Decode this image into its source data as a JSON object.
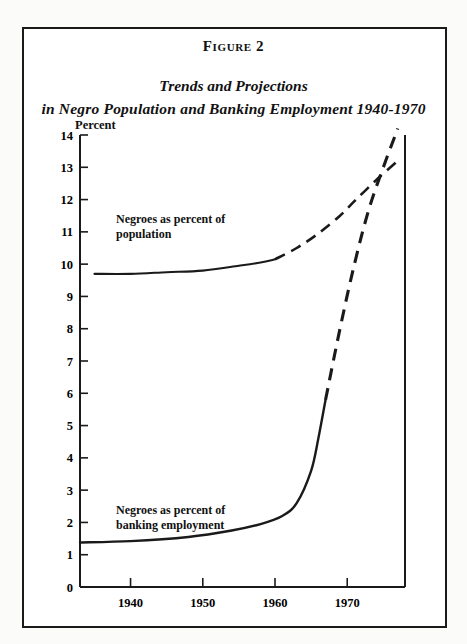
{
  "figure": {
    "number_label": "Figure 2",
    "title_line1": "Trends and Projections",
    "title_line2": "in Negro Population and Banking Employment 1940-1970",
    "unit_label": "Percent"
  },
  "annotations": {
    "population": {
      "line1": "Negroes as percent of",
      "line2": "population"
    },
    "banking": {
      "line1": "Negroes as percent of",
      "line2": "banking employment"
    }
  },
  "colors": {
    "ink": "#1a1a1a",
    "paper": "#ffffff",
    "page": "#fbfbfa"
  },
  "chart_data": {
    "type": "line",
    "title": "Trends and Projections in Negro Population and Banking Employment 1940-1970",
    "xlabel": "",
    "ylabel": "Percent",
    "xlim": [
      1933,
      1978
    ],
    "ylim": [
      0,
      14
    ],
    "grid": false,
    "legend": "inline-annotations",
    "yticks": [
      0,
      1,
      2,
      3,
      4,
      5,
      6,
      7,
      8,
      9,
      10,
      11,
      12,
      13,
      14
    ],
    "ytick_labels": [
      "0",
      "1",
      "2",
      "3",
      "4",
      "5",
      "6",
      "7",
      "8",
      "9",
      "10",
      "11",
      "12",
      "13",
      "14"
    ],
    "xticks": [
      1940,
      1950,
      1960,
      1970
    ],
    "xtick_labels": [
      "1940",
      "1950",
      "1960",
      "1970"
    ],
    "series": [
      {
        "name": "Negroes as percent of population",
        "style": "solid-then-dashed",
        "solid_x": [
          1935,
          1940,
          1945,
          1950,
          1955,
          1958,
          1960
        ],
        "solid_y": [
          9.7,
          9.7,
          9.75,
          9.8,
          9.95,
          10.05,
          10.15
        ],
        "dashed_x": [
          1960,
          1963,
          1966,
          1969,
          1971,
          1974,
          1977
        ],
        "dashed_y": [
          10.15,
          10.5,
          10.95,
          11.5,
          11.95,
          12.6,
          13.2
        ]
      },
      {
        "name": "Negroes as percent of banking employment",
        "style": "solid-then-dashed",
        "solid_x": [
          1933,
          1940,
          1948,
          1954,
          1958,
          1961,
          1963,
          1965,
          1966,
          1967
        ],
        "solid_y": [
          1.38,
          1.42,
          1.55,
          1.75,
          1.95,
          2.2,
          2.6,
          3.6,
          4.6,
          5.8
        ],
        "dashed_x": [
          1967,
          1969,
          1971,
          1973,
          1975,
          1977
        ],
        "dashed_y": [
          5.8,
          8.0,
          10.0,
          11.7,
          13.0,
          14.2
        ]
      }
    ],
    "annotations": [
      {
        "text": "Negroes as percent of population",
        "x": 1941,
        "y": 10.6
      },
      {
        "text": "Negroes as percent of banking employment",
        "x": 1941,
        "y": 2.5
      }
    ]
  }
}
